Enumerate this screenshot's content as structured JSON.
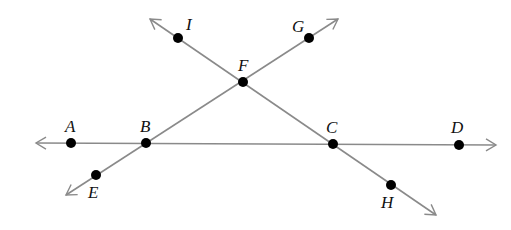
{
  "figure": {
    "type": "intersecting-lines",
    "colors": {
      "line": "#8a8a8a",
      "point": "#000000",
      "label": "#111111"
    },
    "lines": [
      {
        "name": "line-AD",
        "from": [
          36,
          143
        ],
        "to": [
          496,
          145
        ],
        "arrows": "both"
      },
      {
        "name": "line-EG",
        "from": [
          66,
          195
        ],
        "to": [
          338,
          19
        ],
        "arrows": "both"
      },
      {
        "name": "line-IH",
        "from": [
          150,
          19
        ],
        "to": [
          436,
          215
        ],
        "arrows": "both"
      }
    ],
    "points": [
      {
        "id": "A",
        "label": "A",
        "x": 71,
        "y": 143,
        "lx": 65,
        "ly": 132
      },
      {
        "id": "B",
        "label": "B",
        "x": 146,
        "y": 143,
        "lx": 140,
        "ly": 132
      },
      {
        "id": "C",
        "label": "C",
        "x": 333,
        "y": 144,
        "lx": 326,
        "ly": 133
      },
      {
        "id": "D",
        "label": "D",
        "x": 459,
        "y": 145,
        "lx": 451,
        "ly": 133
      },
      {
        "id": "E",
        "label": "E",
        "x": 96,
        "y": 175,
        "lx": 88,
        "ly": 198
      },
      {
        "id": "F",
        "label": "F",
        "x": 243,
        "y": 82,
        "lx": 238,
        "ly": 71
      },
      {
        "id": "G",
        "label": "G",
        "x": 309,
        "y": 38,
        "lx": 292,
        "ly": 32
      },
      {
        "id": "H",
        "label": "H",
        "x": 391,
        "y": 185,
        "lx": 381,
        "ly": 208
      },
      {
        "id": "I",
        "label": "I",
        "x": 178,
        "y": 38,
        "lx": 186,
        "ly": 30
      }
    ]
  }
}
